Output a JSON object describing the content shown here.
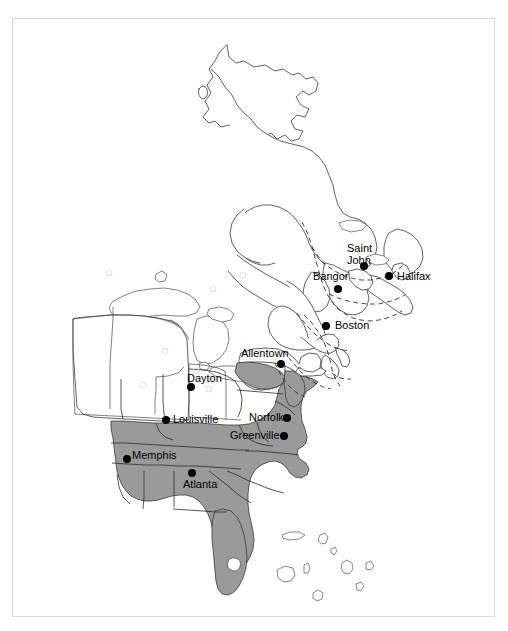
{
  "figure": {
    "background_color": "#ffffff",
    "frame_color": "#d8d8d8",
    "frame": {
      "x": 12,
      "y": 18,
      "width": 483,
      "height": 599
    }
  },
  "legend_colors": {
    "shaded_region_fill": "#9a9a9a",
    "unshaded_region_fill": "#ffffff",
    "coastline_stroke": "#3a3a3a",
    "internal_border_stroke": "#4a4a4a",
    "dashed_boundary_stroke": "#333333",
    "city_marker_fill": "#000000",
    "label_text_color": "#000000"
  },
  "map": {
    "region_name": "Eastern North America",
    "projection_note": "",
    "shaded_states_note": "Southeastern and mid-Atlantic states are filled gray",
    "cities": [
      {
        "name": "Saint John",
        "label_lines": [
          "Saint",
          "John"
        ],
        "dot": {
          "x": 363,
          "y": 265
        },
        "label": {
          "x": 346,
          "y": 241
        },
        "label_align": "left"
      },
      {
        "name": "Halifax",
        "label_lines": [
          "Halifax"
        ],
        "dot": {
          "x": 388,
          "y": 275
        },
        "label": {
          "x": 396,
          "y": 269
        },
        "label_align": "left"
      },
      {
        "name": "Bangor",
        "label_lines": [
          "Bangor"
        ],
        "dot": {
          "x": 337,
          "y": 288
        },
        "label": {
          "x": 312,
          "y": 269
        },
        "label_align": "left"
      },
      {
        "name": "Boston",
        "label_lines": [
          "Boston"
        ],
        "dot": {
          "x": 325,
          "y": 325
        },
        "label": {
          "x": 334,
          "y": 318
        },
        "label_align": "left"
      },
      {
        "name": "Allentown",
        "label_lines": [
          "Allentown"
        ],
        "dot": {
          "x": 280,
          "y": 363
        },
        "label": {
          "x": 240,
          "y": 346
        },
        "label_align": "left"
      },
      {
        "name": "Dayton",
        "label_lines": [
          "Dayton"
        ],
        "dot": {
          "x": 190,
          "y": 386
        },
        "label": {
          "x": 186,
          "y": 371
        },
        "label_align": "left"
      },
      {
        "name": "Louisville",
        "label_lines": [
          "Louisville"
        ],
        "dot": {
          "x": 165,
          "y": 419
        },
        "label": {
          "x": 172,
          "y": 412
        },
        "label_align": "left"
      },
      {
        "name": "Norfolk",
        "label_lines": [
          "Norfolk"
        ],
        "dot": {
          "x": 286,
          "y": 417
        },
        "label": {
          "x": 248,
          "y": 410
        },
        "label_align": "left"
      },
      {
        "name": "Greenville",
        "label_lines": [
          "Greenville"
        ],
        "dot": {
          "x": 283,
          "y": 435
        },
        "label": {
          "x": 229,
          "y": 428
        },
        "label_align": "left"
      },
      {
        "name": "Memphis",
        "label_lines": [
          "Memphis"
        ],
        "dot": {
          "x": 126,
          "y": 458
        },
        "label": {
          "x": 131,
          "y": 448
        },
        "label_align": "left"
      },
      {
        "name": "Atlanta",
        "label_lines": [
          "Atlanta"
        ],
        "dot": {
          "x": 191,
          "y": 472
        },
        "label": {
          "x": 182,
          "y": 477
        },
        "label_align": "left"
      }
    ],
    "water_bodies": [
      "Lake Superior",
      "Lake Michigan",
      "Lake Huron",
      "Lake Erie",
      "Lake Ontario",
      "Lake Okeechobee",
      "Gulf of Saint Lawrence",
      "Atlantic Ocean"
    ],
    "dashed_boundary_note": "Dashed lines mark the Gulf of Maine / Bay of Fundy maritime boundary region"
  }
}
